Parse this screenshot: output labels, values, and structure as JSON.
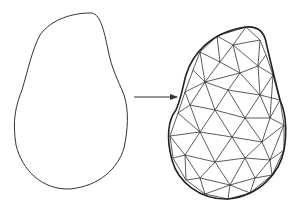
{
  "diagram": {
    "stroke_color": "#333333",
    "background": "#ffffff",
    "left_shape": {
      "label": "",
      "path": "M90,13 C100,12 104,30 108,50 C112,70 118,80 124,95 C129,110 128,130 124,148 C118,168 100,186 70,189 C42,190 22,170 16,145 C12,120 16,105 22,90 C28,70 32,50 40,35 C52,18 75,13 90,13 Z"
    },
    "arrow": {
      "x1": 134,
      "y1": 97,
      "x2": 177,
      "y2": 97
    },
    "right_shape": {
      "boundary": "M246,27 C258,26 264,32 266,42 C270,60 275,80 280,100 C288,118 286,140 284,150 C280,172 260,196 228,199 C200,200 178,182 172,160 C166,138 168,120 176,110 C182,96 183,85 186,75 C192,55 210,32 246,27 Z",
      "nodes": [
        [
          217,
          36
        ],
        [
          246,
          27
        ],
        [
          260,
          40
        ],
        [
          266,
          55
        ],
        [
          273,
          75
        ],
        [
          280,
          100
        ],
        [
          284,
          125
        ],
        [
          284,
          150
        ],
        [
          272,
          175
        ],
        [
          250,
          193
        ],
        [
          228,
          199
        ],
        [
          205,
          194
        ],
        [
          186,
          180
        ],
        [
          173,
          158
        ],
        [
          170,
          136
        ],
        [
          178,
          113
        ],
        [
          185,
          92
        ],
        [
          193,
          70
        ],
        [
          200,
          52
        ],
        [
          233,
          45
        ],
        [
          220,
          62
        ],
        [
          240,
          73
        ],
        [
          258,
          66
        ],
        [
          205,
          82
        ],
        [
          228,
          90
        ],
        [
          260,
          95
        ],
        [
          190,
          105
        ],
        [
          215,
          110
        ],
        [
          245,
          118
        ],
        [
          270,
          118
        ],
        [
          200,
          132
        ],
        [
          232,
          137
        ],
        [
          262,
          142
        ],
        [
          185,
          155
        ],
        [
          215,
          162
        ],
        [
          245,
          158
        ],
        [
          270,
          160
        ],
        [
          200,
          178
        ],
        [
          230,
          185
        ],
        [
          255,
          178
        ]
      ],
      "edges": [
        [
          0,
          19
        ],
        [
          1,
          19
        ],
        [
          2,
          19
        ],
        [
          19,
          20
        ],
        [
          0,
          20
        ],
        [
          0,
          18
        ],
        [
          18,
          20
        ],
        [
          19,
          21
        ],
        [
          19,
          22
        ],
        [
          2,
          22
        ],
        [
          3,
          22
        ],
        [
          20,
          21
        ],
        [
          21,
          22
        ],
        [
          18,
          23
        ],
        [
          20,
          23
        ],
        [
          17,
          23
        ],
        [
          17,
          18
        ],
        [
          21,
          23
        ],
        [
          21,
          24
        ],
        [
          23,
          24
        ],
        [
          22,
          25
        ],
        [
          22,
          4
        ],
        [
          4,
          25
        ],
        [
          21,
          25
        ],
        [
          24,
          25
        ],
        [
          16,
          23
        ],
        [
          16,
          26
        ],
        [
          23,
          26
        ],
        [
          24,
          27
        ],
        [
          26,
          27
        ],
        [
          23,
          27
        ],
        [
          24,
          28
        ],
        [
          25,
          28
        ],
        [
          27,
          28
        ],
        [
          25,
          29
        ],
        [
          4,
          29
        ],
        [
          5,
          29
        ],
        [
          28,
          29
        ],
        [
          5,
          25
        ],
        [
          15,
          26
        ],
        [
          15,
          30
        ],
        [
          26,
          30
        ],
        [
          27,
          30
        ],
        [
          27,
          31
        ],
        [
          28,
          31
        ],
        [
          30,
          31
        ],
        [
          28,
          32
        ],
        [
          29,
          32
        ],
        [
          31,
          32
        ],
        [
          29,
          6
        ],
        [
          6,
          32
        ],
        [
          5,
          6
        ],
        [
          14,
          30
        ],
        [
          14,
          33
        ],
        [
          30,
          33
        ],
        [
          30,
          34
        ],
        [
          31,
          34
        ],
        [
          33,
          34
        ],
        [
          31,
          35
        ],
        [
          32,
          35
        ],
        [
          34,
          35
        ],
        [
          32,
          36
        ],
        [
          35,
          36
        ],
        [
          6,
          36
        ],
        [
          7,
          36
        ],
        [
          6,
          7
        ],
        [
          13,
          33
        ],
        [
          12,
          33
        ],
        [
          12,
          37
        ],
        [
          33,
          37
        ],
        [
          34,
          37
        ],
        [
          34,
          38
        ],
        [
          37,
          38
        ],
        [
          35,
          38
        ],
        [
          35,
          39
        ],
        [
          36,
          39
        ],
        [
          38,
          39
        ],
        [
          8,
          36
        ],
        [
          8,
          39
        ],
        [
          7,
          8
        ],
        [
          11,
          37
        ],
        [
          11,
          38
        ],
        [
          10,
          38
        ],
        [
          9,
          38
        ],
        [
          9,
          39
        ],
        [
          8,
          9
        ],
        [
          12,
          11
        ],
        [
          10,
          11
        ],
        [
          9,
          10
        ],
        [
          13,
          14
        ],
        [
          14,
          15
        ],
        [
          15,
          16
        ],
        [
          16,
          17
        ],
        [
          0,
          1
        ],
        [
          1,
          2
        ],
        [
          2,
          3
        ],
        [
          3,
          4
        ],
        [
          4,
          5
        ],
        [
          12,
          13
        ]
      ]
    }
  }
}
